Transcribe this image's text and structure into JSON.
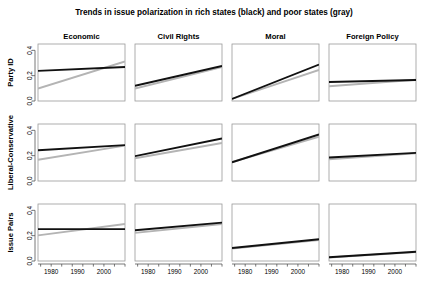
{
  "chart_data": {
    "type": "line",
    "title": "Trends in issue polarization in rich states (black) and poor states (gray)",
    "xlabel": "",
    "ylabel": "",
    "xlim": [
      1975,
      2008
    ],
    "ylim": [
      0,
      0.45
    ],
    "xticks": [
      1980,
      1990,
      2000
    ],
    "xticklabels": [
      "1980",
      "1990",
      "2000"
    ],
    "yticks": [
      0.0,
      0.2,
      0.4
    ],
    "yticklabels": [
      "0.0",
      "0.2",
      "0.4"
    ],
    "grid": false,
    "legend_position": "none",
    "legend_entries": [
      "rich states (black)",
      "poor states (gray)"
    ],
    "row_labels": [
      "Party ID",
      "Liberal-Conservative",
      "Issue Pairs"
    ],
    "column_labels": [
      "Economic",
      "Civil Rights",
      "Moral",
      "Foreign Policy"
    ],
    "series_colors": {
      "rich": "#111111",
      "poor": "#b4b4b4"
    },
    "panels": [
      {
        "row": "Party ID",
        "column": "Economic",
        "x": [
          1975,
          2008
        ],
        "series": [
          {
            "name": "rich states",
            "key": "rich",
            "values": [
              0.238,
              0.268
            ]
          },
          {
            "name": "poor states",
            "key": "poor",
            "values": [
              0.098,
              0.312
            ]
          }
        ]
      },
      {
        "row": "Party ID",
        "column": "Civil Rights",
        "x": [
          1975,
          2008
        ],
        "series": [
          {
            "name": "rich states",
            "key": "rich",
            "values": [
              0.12,
              0.277
            ]
          },
          {
            "name": "poor states",
            "key": "poor",
            "values": [
              0.098,
              0.268
            ]
          }
        ]
      },
      {
        "row": "Party ID",
        "column": "Moral",
        "x": [
          1975,
          2008
        ],
        "series": [
          {
            "name": "rich states",
            "key": "rich",
            "values": [
              0.016,
              0.288
            ]
          },
          {
            "name": "poor states",
            "key": "poor",
            "values": [
              0.016,
              0.245
            ]
          }
        ]
      },
      {
        "row": "Party ID",
        "column": "Foreign Policy",
        "x": [
          1975,
          2008
        ],
        "series": [
          {
            "name": "rich states",
            "key": "rich",
            "values": [
              0.15,
              0.166
            ]
          },
          {
            "name": "poor states",
            "key": "poor",
            "values": [
              0.117,
              0.168
            ]
          }
        ]
      },
      {
        "row": "Liberal-Conservative",
        "column": "Economic",
        "x": [
          1975,
          2008
        ],
        "series": [
          {
            "name": "rich states",
            "key": "rich",
            "values": [
              0.243,
              0.283
            ]
          },
          {
            "name": "poor states",
            "key": "poor",
            "values": [
              0.168,
              0.279
            ]
          }
        ]
      },
      {
        "row": "Liberal-Conservative",
        "column": "Civil Rights",
        "x": [
          1975,
          2008
        ],
        "series": [
          {
            "name": "rich states",
            "key": "rich",
            "values": [
              0.196,
              0.336
            ]
          },
          {
            "name": "poor states",
            "key": "poor",
            "values": [
              0.18,
              0.3
            ]
          }
        ]
      },
      {
        "row": "Liberal-Conservative",
        "column": "Moral",
        "x": [
          1975,
          2008
        ],
        "series": [
          {
            "name": "rich states",
            "key": "rich",
            "values": [
              0.148,
              0.368
            ]
          },
          {
            "name": "poor states",
            "key": "poor",
            "values": [
              0.15,
              0.35
            ]
          }
        ]
      },
      {
        "row": "Liberal-Conservative",
        "column": "Foreign Policy",
        "x": [
          1975,
          2008
        ],
        "series": [
          {
            "name": "rich states",
            "key": "rich",
            "values": [
              0.186,
              0.222
            ]
          },
          {
            "name": "poor states",
            "key": "poor",
            "values": [
              0.172,
              0.218
            ]
          }
        ]
      },
      {
        "row": "Issue Pairs",
        "column": "Economic",
        "x": [
          1975,
          2008
        ],
        "series": [
          {
            "name": "rich states",
            "key": "rich",
            "values": [
              0.252,
              0.252
            ]
          },
          {
            "name": "poor states",
            "key": "poor",
            "values": [
              0.202,
              0.292
            ]
          }
        ]
      },
      {
        "row": "Issue Pairs",
        "column": "Civil Rights",
        "x": [
          1975,
          2008
        ],
        "series": [
          {
            "name": "rich states",
            "key": "rich",
            "values": [
              0.243,
              0.303
            ]
          },
          {
            "name": "poor states",
            "key": "poor",
            "values": [
              0.222,
              0.292
            ]
          }
        ]
      },
      {
        "row": "Issue Pairs",
        "column": "Moral",
        "x": [
          1975,
          2008
        ],
        "series": [
          {
            "name": "rich states",
            "key": "rich",
            "values": [
              0.103,
              0.172
            ]
          },
          {
            "name": "poor states",
            "key": "poor",
            "values": [
              0.098,
              0.166
            ]
          }
        ]
      },
      {
        "row": "Issue Pairs",
        "column": "Foreign Policy",
        "x": [
          1975,
          2008
        ],
        "series": [
          {
            "name": "rich states",
            "key": "rich",
            "values": [
              0.03,
              0.073
            ]
          },
          {
            "name": "poor states",
            "key": "poor",
            "values": [
              0.028,
              0.07
            ]
          }
        ]
      }
    ]
  }
}
